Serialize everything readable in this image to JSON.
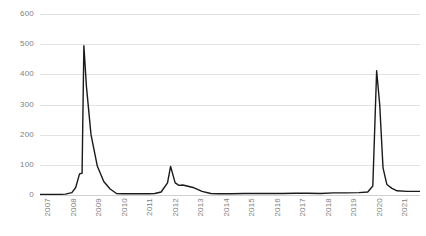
{
  "chart_data": {
    "type": "line",
    "title": "",
    "subtitle": "",
    "xlabel": "",
    "ylabel": "",
    "grid": true,
    "legend": "none",
    "ylim": [
      0,
      600
    ],
    "ytick_labels": [
      "0",
      "100",
      "200",
      "300",
      "400",
      "500",
      "600"
    ],
    "yticks": [
      0,
      100,
      200,
      300,
      400,
      500,
      600
    ],
    "xtick_labels": [
      "2007",
      "2008",
      "2009",
      "2010",
      "2011",
      "2012",
      "2013",
      "2014",
      "2015",
      "2016",
      "2017",
      "2018",
      "2019",
      "2020",
      "2021"
    ],
    "xticks": [
      2007,
      2008,
      2009,
      2010,
      2011,
      2012,
      2013,
      2014,
      2015,
      2016,
      2017,
      2018,
      2019,
      2020,
      2021
    ],
    "xlim": [
      2007,
      2021.9
    ],
    "series": [
      {
        "name": "series-1",
        "color": "#1a1a1a",
        "x": [
          2007.0,
          2007.25,
          2007.5,
          2007.75,
          2008.0,
          2008.25,
          2008.4,
          2008.55,
          2008.65,
          2008.72,
          2008.82,
          2009.0,
          2009.25,
          2009.5,
          2009.75,
          2010.0,
          2010.25,
          2010.5,
          2010.75,
          2011.0,
          2011.25,
          2011.5,
          2011.75,
          2012.0,
          2012.12,
          2012.3,
          2012.45,
          2012.6,
          2013.0,
          2013.35,
          2013.7,
          2014.0,
          2014.5,
          2015.0,
          2015.5,
          2016.0,
          2016.5,
          2017.0,
          2017.5,
          2018.0,
          2018.5,
          2019.0,
          2019.5,
          2019.85,
          2020.05,
          2020.2,
          2020.32,
          2020.45,
          2020.6,
          2020.8,
          2021.0,
          2021.4,
          2021.9
        ],
        "values": [
          2,
          2,
          2,
          2,
          3,
          8,
          25,
          70,
          72,
          495,
          360,
          200,
          95,
          45,
          20,
          5,
          4,
          4,
          4,
          4,
          4,
          5,
          10,
          40,
          95,
          40,
          32,
          33,
          25,
          12,
          5,
          4,
          4,
          5,
          5,
          5,
          5,
          6,
          6,
          5,
          7,
          7,
          8,
          10,
          30,
          412,
          300,
          90,
          35,
          22,
          14,
          12,
          12
        ]
      }
    ],
    "peaks": [
      {
        "label": "2008-peak",
        "x": 2008.72,
        "y": 495
      },
      {
        "label": "2012-peak",
        "x": 2012.12,
        "y": 95
      },
      {
        "label": "2020-peak",
        "x": 2020.2,
        "y": 412
      }
    ],
    "colors": {
      "line": "#1a1a1a",
      "grid": "#e3e3e3",
      "axis_text": "#7f7f7f",
      "background": "#ffffff"
    }
  }
}
